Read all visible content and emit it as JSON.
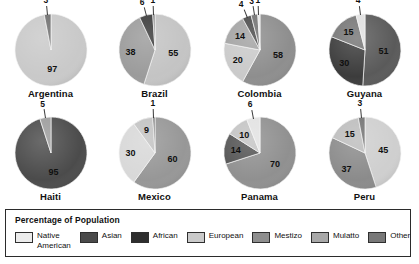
{
  "chart_data": {
    "type": "pie",
    "title": "Percentage of Population",
    "xlabel": "",
    "ylabel": "",
    "units": "percent",
    "legend_position": "bottom",
    "grid": false,
    "categories": [
      "Native American",
      "Asian",
      "African",
      "European",
      "Mestizo",
      "Mulatto",
      "Other"
    ],
    "category_colors": {
      "Native American": "#e8e8e8",
      "Asian": "#4a4a4a",
      "African": "#2e2e2e",
      "European": "#c9c9c9",
      "Mestizo": "#8e8e8e",
      "Mulatto": "#a5a5a5",
      "Other": "#777777"
    },
    "charts": [
      {
        "title": "Argentina",
        "slices": [
          {
            "label": "97",
            "value": 97,
            "category": "European",
            "color": "#c9c9c9",
            "outside": false
          },
          {
            "label": "3",
            "value": 3,
            "category": "Mestizo",
            "color": "#6f6f6f",
            "outside": true
          }
        ]
      },
      {
        "title": "Brazil",
        "slices": [
          {
            "label": "55",
            "value": 55,
            "category": "European",
            "color": "#c4c4c4",
            "outside": false
          },
          {
            "label": "38",
            "value": 38,
            "category": "Mulatto",
            "color": "#9b9b9b",
            "outside": false
          },
          {
            "label": "6",
            "value": 6,
            "category": "African",
            "color": "#3a3a3a",
            "outside": true
          },
          {
            "label": "1",
            "value": 1,
            "category": "Other",
            "color": "#7a7a7a",
            "outside": true
          }
        ]
      },
      {
        "title": "Colombia",
        "slices": [
          {
            "label": "58",
            "value": 58,
            "category": "Mestizo",
            "color": "#8e8e8e",
            "outside": false
          },
          {
            "label": "20",
            "value": 20,
            "category": "European",
            "color": "#cacaca",
            "outside": false
          },
          {
            "label": "14",
            "value": 14,
            "category": "Mulatto",
            "color": "#a3a3a3",
            "outside": false
          },
          {
            "label": "4",
            "value": 4,
            "category": "African",
            "color": "#4a4a4a",
            "outside": true
          },
          {
            "label": "3",
            "value": 3,
            "category": "Other",
            "color": "#727272",
            "outside": true
          },
          {
            "label": "1",
            "value": 1,
            "category": "Native American",
            "color": "#e4e4e4",
            "outside": true
          }
        ]
      },
      {
        "title": "Guyana",
        "slices": [
          {
            "label": "51",
            "value": 51,
            "category": "Asian",
            "color": "#5a5a5a",
            "outside": false
          },
          {
            "label": "30",
            "value": 30,
            "category": "African",
            "color": "#3c3c3c",
            "outside": false
          },
          {
            "label": "15",
            "value": 15,
            "category": "Mulatto",
            "color": "#767676",
            "outside": false
          },
          {
            "label": "4",
            "value": 4,
            "category": "Native American",
            "color": "#e0e0e0",
            "outside": true
          }
        ]
      },
      {
        "title": "Haiti",
        "slices": [
          {
            "label": "95",
            "value": 95,
            "category": "African",
            "color": "#4b4b4b",
            "outside": false
          },
          {
            "label": "5",
            "value": 5,
            "category": "Mulatto",
            "color": "#9c9c9c",
            "outside": true
          }
        ]
      },
      {
        "title": "Mexico",
        "slices": [
          {
            "label": "60",
            "value": 60,
            "category": "Mestizo",
            "color": "#979797",
            "outside": false
          },
          {
            "label": "30",
            "value": 30,
            "category": "Native American",
            "color": "#d8d8d8",
            "outside": false
          },
          {
            "label": "9",
            "value": 9,
            "category": "European",
            "color": "#c2c2c2",
            "outside": false
          },
          {
            "label": "1",
            "value": 1,
            "category": "Other",
            "color": "#6f6f6f",
            "outside": true
          }
        ]
      },
      {
        "title": "Panama",
        "slices": [
          {
            "label": "70",
            "value": 70,
            "category": "Mestizo",
            "color": "#909090",
            "outside": false
          },
          {
            "label": "14",
            "value": 14,
            "category": "African",
            "color": "#555555",
            "outside": false
          },
          {
            "label": "10",
            "value": 10,
            "category": "European",
            "color": "#c4c4c4",
            "outside": false
          },
          {
            "label": "6",
            "value": 6,
            "category": "Native American",
            "color": "#e2e2e2",
            "outside": true
          }
        ]
      },
      {
        "title": "Peru",
        "slices": [
          {
            "label": "45",
            "value": 45,
            "category": "Native American",
            "color": "#cfcfcf",
            "outside": false
          },
          {
            "label": "37",
            "value": 37,
            "category": "Mestizo",
            "color": "#8b8b8b",
            "outside": false
          },
          {
            "label": "15",
            "value": 15,
            "category": "European",
            "color": "#bdbdbd",
            "outside": false
          },
          {
            "label": "3",
            "value": 3,
            "category": "Other",
            "color": "#737373",
            "outside": true
          }
        ]
      }
    ]
  },
  "legend": {
    "title": "Percentage of Population",
    "items": [
      {
        "label": "Native\nAmerican",
        "color": "#ececec"
      },
      {
        "label": "Asian",
        "color": "#4a4a4a"
      },
      {
        "label": "African",
        "color": "#2e2e2e"
      },
      {
        "label": "European",
        "color": "#cacaca"
      },
      {
        "label": "Mestizo",
        "color": "#8e8e8e"
      },
      {
        "label": "Mulatto",
        "color": "#a8a8a8"
      },
      {
        "label": "Other",
        "color": "#787878"
      }
    ]
  }
}
